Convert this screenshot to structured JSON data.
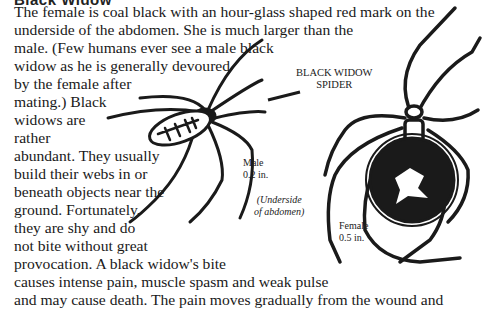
{
  "document": {
    "heading": "Black Widow",
    "paragraph_lines": [
      "The female is coal black with an hour-glass shaped red mark on the",
      "underside of the abdomen. She is much larger than the",
      "male. (Few humans ever see a male black",
      "widow as he is generally devoured",
      "by the female after",
      "mating.) Black",
      "widows are",
      "rather",
      "abundant. They usually",
      "build their webs in or",
      "beneath objects near the",
      "ground. Fortunately,",
      "they are shy and do",
      "not bite without great",
      "provocation. A black widow's bite",
      "causes intense pain, muscle spasm and weak pulse",
      "and may cause death. The pain moves gradually from the wound and"
    ]
  },
  "illustration": {
    "title_line1": "BLACK WIDOW",
    "title_line2": "SPIDER",
    "male_label": "Male",
    "male_size": "0.2 in.",
    "underside_line1": "(Underside",
    "underside_line2": "of abdomen)",
    "female_label": "Female",
    "female_size": "0.5 in."
  }
}
